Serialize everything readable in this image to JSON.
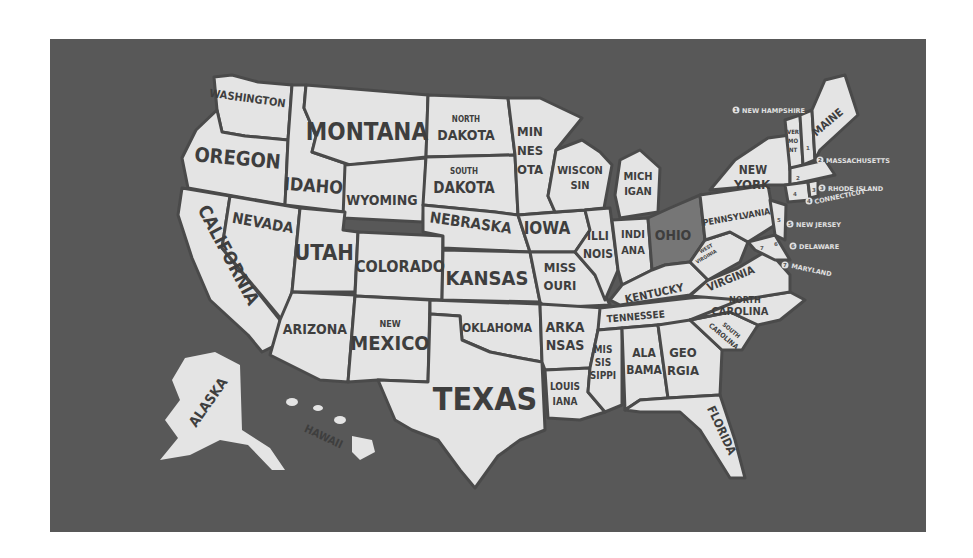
{
  "map": {
    "title": "United States poster map",
    "colors": {
      "background": "#585858",
      "land": "#e4e4e4",
      "border": "#4a4a4a",
      "highlight": "#767676",
      "text": "#3e3e3e"
    },
    "highlighted_state": "OHIO",
    "states": {
      "washington": "WASHINGTON",
      "oregon": "OREGON",
      "california": "CALIFORNIA",
      "nevada": "NEVADA",
      "idaho": "IDAHO",
      "montana": "MONTANA",
      "wyoming": "WYOMING",
      "utah": "UTAH",
      "arizona": "ARIZONA",
      "colorado": "COLORADO",
      "new_mexico_1": "NEW",
      "new_mexico_2": "MEXICO",
      "north_dakota_1": "NORTH",
      "north_dakota_2": "DAKOTA",
      "south_dakota_1": "SOUTH",
      "south_dakota_2": "DAKOTA",
      "nebraska": "NEBRASKA",
      "kansas": "KANSAS",
      "oklahoma": "OKLAHOMA",
      "texas": "TEXAS",
      "minnesota_1": "MIN",
      "minnesota_2": "NES",
      "minnesota_3": "OTA",
      "iowa": "IOWA",
      "missouri_1": "MISS",
      "missouri_2": "OURI",
      "arkansas_1": "ARKA",
      "arkansas_2": "NSAS",
      "louisiana_1": "LOUIS",
      "louisiana_2": "IANA",
      "wisconsin_1": "WISCON",
      "wisconsin_2": "SIN",
      "illinois_1": "ILLI",
      "illinois_2": "NOIS",
      "michigan_1": "MICH",
      "michigan_2": "IGAN",
      "indiana_1": "INDI",
      "indiana_2": "ANA",
      "ohio": "OHIO",
      "kentucky": "KENTUCKY",
      "tennessee": "TENNESSEE",
      "mississippi_1": "MIS",
      "mississippi_2": "SIS",
      "mississippi_3": "SIPPI",
      "alabama_1": "ALA",
      "alabama_2": "BAMA",
      "georgia_1": "GEO",
      "georgia_2": "RGIA",
      "florida": "FLORIDA",
      "south_carolina_1": "SOUTH",
      "south_carolina_2": "CAROLINA",
      "north_carolina_1": "NORTH",
      "north_carolina_2": "CAROLINA",
      "virginia": "VIRGINIA",
      "west_virginia_1": "WEST",
      "west_virginia_2": "VIRGINIA",
      "pennsylvania": "PENNSYLVANIA",
      "new_york_1": "NEW",
      "new_york_2": "YORK",
      "vermont_1": "VER",
      "vermont_2": "MO",
      "vermont_3": "NT",
      "maine": "MAINE",
      "alaska": "ALASKA",
      "hawaii": "HAWAII"
    },
    "callouts": [
      {
        "num": "1",
        "label": "NEW HAMPSHIRE"
      },
      {
        "num": "2",
        "label": "MASSACHUSETTS"
      },
      {
        "num": "3",
        "label": "RHODE ISLAND"
      },
      {
        "num": "4",
        "label": "CONNECTICUT"
      },
      {
        "num": "5",
        "label": "NEW JERSEY"
      },
      {
        "num": "6",
        "label": "DELAWARE"
      },
      {
        "num": "7",
        "label": "MARYLAND"
      }
    ]
  }
}
